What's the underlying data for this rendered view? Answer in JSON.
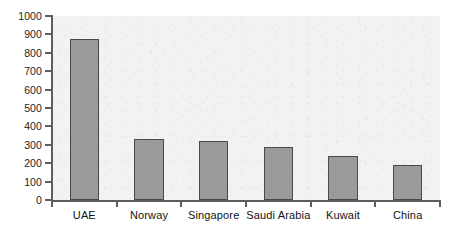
{
  "chart_data": {
    "type": "bar",
    "title": "",
    "subtitle": "",
    "xlabel": "",
    "ylabel": "",
    "categories": [
      "UAE",
      "Norway",
      "Singapore",
      "Saudi Arabia",
      "Kuwait",
      "China"
    ],
    "values": [
      875,
      330,
      320,
      290,
      240,
      190
    ],
    "ylim": [
      0,
      1000
    ],
    "ytick_labels": [
      "0",
      "100",
      "200",
      "300",
      "400",
      "500",
      "600",
      "700",
      "800",
      "900",
      "1000"
    ],
    "ytick_values": [
      0,
      100,
      200,
      300,
      400,
      500,
      600,
      700,
      800,
      900,
      1000
    ],
    "grid": false,
    "legend": false,
    "legend_position": "none",
    "bar_color": "#9a9a9a",
    "bar_border_color": "#4a4a4a",
    "axis_color": "#5e5e5e",
    "plot_background": "#f2f2f0"
  }
}
